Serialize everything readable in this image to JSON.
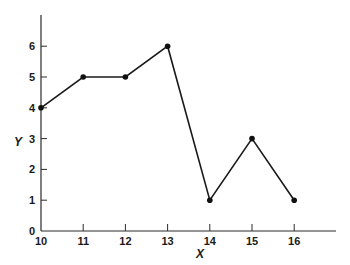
{
  "chart_data": {
    "type": "line",
    "title": "",
    "xlabel": "X",
    "ylabel": "Y",
    "x": [
      10,
      11,
      12,
      13,
      14,
      15,
      16
    ],
    "series": [
      {
        "name": "Y",
        "values": [
          4,
          5,
          5,
          6,
          1,
          3,
          1
        ]
      }
    ],
    "xticks": [
      "10",
      "11",
      "12",
      "13",
      "14",
      "15",
      "16"
    ],
    "yticks": [
      "0",
      "1",
      "2",
      "3",
      "4",
      "5",
      "6"
    ],
    "xlim": [
      10,
      17
    ],
    "ylim": [
      0,
      7
    ],
    "grid": false,
    "legend": null,
    "markers": true,
    "colors": {
      "line": "#1a1a1a",
      "axis": "#2a2a2a"
    }
  }
}
